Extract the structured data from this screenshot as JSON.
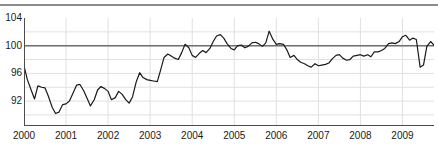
{
  "chart_data": {
    "type": "line",
    "title": "",
    "subtitle": "",
    "xlabel": "",
    "ylabel": "",
    "xlim": [
      2000.0,
      2009.75
    ],
    "ylim": [
      88.4,
      104.0
    ],
    "grid": true,
    "grid_y_step": 2,
    "legend": null,
    "legend_position": "none",
    "y_ticks": [
      104,
      100,
      96,
      92
    ],
    "y_tick_labels": [
      "104",
      "100",
      "96",
      "92"
    ],
    "x_ticks": [
      2000,
      2001,
      2002,
      2003,
      2004,
      2005,
      2006,
      2007,
      2008,
      2009
    ],
    "x_tick_labels": [
      "2000",
      "2001",
      "2002",
      "2003",
      "2004",
      "2005",
      "2006",
      "2007",
      "2008",
      "2009"
    ],
    "reference_line": {
      "value": 100,
      "color": "#6e6e6e",
      "label": "100"
    },
    "series": [
      {
        "name": "index",
        "color": "#1a1a1a",
        "x": [
          2000.0,
          2000.08,
          2000.17,
          2000.25,
          2000.33,
          2000.42,
          2000.5,
          2000.58,
          2000.67,
          2000.75,
          2000.83,
          2000.92,
          2001.0,
          2001.08,
          2001.17,
          2001.25,
          2001.33,
          2001.42,
          2001.5,
          2001.58,
          2001.67,
          2001.75,
          2001.83,
          2001.92,
          2002.0,
          2002.08,
          2002.17,
          2002.25,
          2002.33,
          2002.42,
          2002.5,
          2002.58,
          2002.67,
          2002.75,
          2002.83,
          2002.92,
          2003.0,
          2003.08,
          2003.17,
          2003.25,
          2003.33,
          2003.42,
          2003.5,
          2003.58,
          2003.67,
          2003.75,
          2003.83,
          2003.92,
          2004.0,
          2004.08,
          2004.17,
          2004.25,
          2004.33,
          2004.42,
          2004.5,
          2004.58,
          2004.67,
          2004.75,
          2004.83,
          2004.92,
          2005.0,
          2005.08,
          2005.17,
          2005.25,
          2005.33,
          2005.42,
          2005.5,
          2005.58,
          2005.67,
          2005.75,
          2005.83,
          2005.92,
          2006.0,
          2006.08,
          2006.17,
          2006.25,
          2006.33,
          2006.42,
          2006.5,
          2006.58,
          2006.67,
          2006.75,
          2006.83,
          2006.92,
          2007.0,
          2007.08,
          2007.17,
          2007.25,
          2007.33,
          2007.42,
          2007.5,
          2007.58,
          2007.67,
          2007.75,
          2007.83,
          2007.92,
          2008.0,
          2008.08,
          2008.17,
          2008.25,
          2008.33,
          2008.42,
          2008.5,
          2008.58,
          2008.67,
          2008.75,
          2008.83,
          2008.92,
          2009.0,
          2009.08,
          2009.17,
          2009.25,
          2009.33,
          2009.42,
          2009.5,
          2009.58,
          2009.67,
          2009.75
        ],
        "values": [
          97.1,
          95.1,
          93.6,
          92.3,
          94.2,
          94.0,
          93.9,
          92.7,
          91.1,
          90.2,
          90.4,
          91.5,
          91.6,
          92.0,
          93.2,
          94.3,
          94.4,
          93.5,
          92.4,
          91.3,
          92.2,
          93.6,
          94.1,
          93.8,
          93.4,
          92.2,
          92.5,
          93.4,
          93.0,
          92.2,
          91.7,
          92.6,
          94.8,
          96.1,
          95.4,
          95.1,
          95.0,
          94.9,
          94.8,
          96.5,
          98.3,
          98.8,
          98.5,
          98.2,
          98.0,
          99.0,
          100.2,
          99.7,
          98.6,
          98.3,
          98.9,
          99.3,
          99.0,
          99.6,
          100.6,
          101.4,
          101.6,
          101.1,
          100.3,
          99.6,
          99.4,
          100.0,
          100.1,
          99.7,
          99.9,
          100.4,
          100.5,
          100.3,
          99.9,
          100.4,
          102.1,
          100.9,
          100.2,
          100.3,
          100.2,
          99.4,
          98.3,
          98.6,
          98.0,
          97.6,
          97.4,
          97.1,
          96.9,
          97.4,
          97.1,
          97.2,
          97.3,
          97.5,
          98.1,
          98.6,
          98.7,
          98.2,
          97.9,
          98.0,
          98.5,
          98.6,
          98.7,
          98.5,
          98.7,
          98.4,
          99.1,
          99.1,
          99.3,
          99.6,
          100.3,
          100.4,
          100.3,
          100.6,
          101.3,
          101.5,
          100.8,
          101.1,
          100.9,
          96.9,
          97.2,
          99.9,
          100.6,
          100.1
        ]
      },
      {
        "name": "index_tail",
        "color": "#1a1a1a",
        "x": [
          2009.75,
          2009.83,
          2009.92,
          2010.0
        ],
        "values": [
          100.1,
          100.8,
          100.5,
          100.8
        ]
      }
    ]
  },
  "axes": {
    "line_color": "#4d4d4d",
    "grid_color": "#e0e0e0",
    "tick_text_color": "#1a1a1a"
  },
  "header": {
    "rule_color": "#8c8c8c"
  }
}
